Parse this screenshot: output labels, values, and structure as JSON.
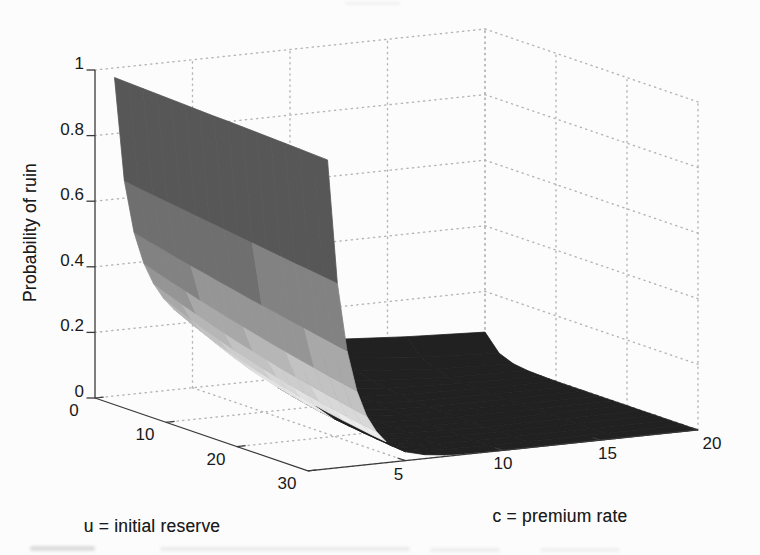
{
  "chart_data": {
    "type": "surface3d",
    "z_label": "Probability of ruin",
    "u_label": "u = initial reserve",
    "c_label": "c = premium rate",
    "u_range": [
      0,
      30
    ],
    "c_range": [
      1,
      20
    ],
    "z_range": [
      0,
      1
    ],
    "u_ticks": [
      0,
      10,
      20,
      30
    ],
    "c_ticks": [
      5,
      10,
      15,
      20
    ],
    "z_ticks": [
      0,
      0.2,
      0.4,
      0.6,
      0.8,
      1
    ],
    "u_tick_labels": [
      "0",
      "10",
      "20",
      "30"
    ],
    "c_tick_labels": [
      "5",
      "10",
      "15",
      "20"
    ],
    "z_tick_labels": [
      "0",
      "0.2",
      "0.4",
      "0.6",
      "0.8",
      "1"
    ],
    "grid": true,
    "grid_style": "dotted",
    "grid_color": "#b5b5b5",
    "axis_color": "#3a3a3a",
    "text_color": "#191919",
    "background_color": "#fcfcfc",
    "u_values": [
      0,
      2,
      4,
      6,
      8,
      10,
      12,
      14,
      16,
      18,
      20,
      22,
      24,
      26,
      28,
      30
    ],
    "c_values": [
      1,
      1.5,
      2,
      2.5,
      3,
      3.5,
      4,
      5,
      6,
      7,
      8,
      10,
      12,
      16,
      20
    ],
    "z_values": [
      [
        0.971,
        0.969,
        0.967,
        0.965,
        0.963,
        0.961,
        0.959,
        0.957,
        0.956,
        0.954,
        0.952,
        0.95,
        0.948,
        0.946,
        0.944,
        0.942
      ],
      [
        0.654,
        0.647,
        0.641,
        0.635,
        0.629,
        0.623,
        0.617,
        0.611,
        0.605,
        0.599,
        0.593,
        0.587,
        0.581,
        0.576,
        0.57,
        0.564
      ],
      [
        0.493,
        0.482,
        0.472,
        0.461,
        0.451,
        0.442,
        0.432,
        0.423,
        0.413,
        0.404,
        0.396,
        0.387,
        0.379,
        0.37,
        0.362,
        0.354
      ],
      [
        0.395,
        0.381,
        0.367,
        0.354,
        0.341,
        0.329,
        0.317,
        0.306,
        0.295,
        0.284,
        0.274,
        0.264,
        0.255,
        0.245,
        0.237,
        0.228
      ],
      [
        0.33,
        0.313,
        0.297,
        0.282,
        0.267,
        0.253,
        0.24,
        0.228,
        0.216,
        0.205,
        0.194,
        0.184,
        0.175,
        0.166,
        0.157,
        0.149
      ],
      [
        0.283,
        0.264,
        0.245,
        0.229,
        0.213,
        0.198,
        0.185,
        0.172,
        0.16,
        0.149,
        0.139,
        0.13,
        0.121,
        0.112,
        0.105,
        0.098
      ],
      [
        0.248,
        0.227,
        0.207,
        0.189,
        0.173,
        0.158,
        0.144,
        0.132,
        0.121,
        0.11,
        0.101,
        0.092,
        0.084,
        0.077,
        0.07,
        0.064
      ],
      [
        0.199,
        0.174,
        0.153,
        0.134,
        0.117,
        0.103,
        0.09,
        0.079,
        0.069,
        0.06,
        0.053,
        0.047,
        0.041,
        0.036,
        0.031,
        0.027
      ],
      [
        0.166,
        0.139,
        0.116,
        0.097,
        0.081,
        0.068,
        0.057,
        0.048,
        0.04,
        0.034,
        0.028,
        0.023,
        0.02,
        0.016,
        0.014,
        0.012
      ],
      [
        0.142,
        0.113,
        0.09,
        0.072,
        0.057,
        0.046,
        0.036,
        0.029,
        0.023,
        0.018,
        0.015,
        0.012,
        0.009,
        0.007,
        0.006,
        0.005
      ],
      [
        0.132,
        0.1,
        0.075,
        0.057,
        0.043,
        0.033,
        0.025,
        0.019,
        0.014,
        0.011,
        0.008,
        0.006,
        0.005,
        0.004,
        0.003,
        0.002
      ],
      [
        0.115,
        0.078,
        0.052,
        0.036,
        0.024,
        0.016,
        0.011,
        0.007,
        0.005,
        0.003,
        0.002,
        0.002,
        0.001,
        0.001,
        0.0,
        0.0
      ],
      [
        0.103,
        0.062,
        0.037,
        0.022,
        0.013,
        0.008,
        0.005,
        0.003,
        0.002,
        0.001,
        0.001,
        0.0,
        0.0,
        0.0,
        0.0,
        0.0
      ],
      [
        0.087,
        0.04,
        0.018,
        0.008,
        0.004,
        0.002,
        0.001,
        0.0,
        0.0,
        0.0,
        0.0,
        0.0,
        0.0,
        0.0,
        0.0,
        0.0
      ],
      [
        0.076,
        0.026,
        0.009,
        0.003,
        0.001,
        0.0,
        0.0,
        0.0,
        0.0,
        0.0,
        0.0,
        0.0,
        0.0,
        0.0,
        0.0,
        0.0
      ]
    ],
    "colormap_thresholds": [
      0.074,
      0.1,
      0.125,
      0.155,
      0.19,
      0.23,
      0.27,
      0.32,
      0.4,
      0.5,
      0.7
    ],
    "colormap_colors": [
      "#212121",
      "#ececec",
      "#e2e2e2",
      "#d8d8d8",
      "#cdcdcd",
      "#c2c2c2",
      "#b6b6b6",
      "#a8a8a8",
      "#959595",
      "#828282",
      "#6f6f6f",
      "#575757"
    ],
    "legend": "none"
  }
}
